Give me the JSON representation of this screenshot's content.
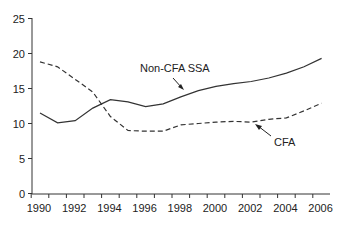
{
  "chart_data": {
    "type": "line",
    "title": "",
    "xlabel": "",
    "ylabel": "",
    "x": [
      1990,
      1991,
      1992,
      1993,
      1994,
      1995,
      1996,
      1997,
      1998,
      1999,
      2000,
      2001,
      2002,
      2003,
      2004,
      2005,
      2006
    ],
    "series": [
      {
        "name": "Non-CFA SSA",
        "style": "solid",
        "values": [
          11.5,
          10.1,
          10.4,
          12.2,
          13.4,
          13.1,
          12.4,
          12.8,
          13.8,
          14.7,
          15.3,
          15.7,
          16.0,
          16.5,
          17.2,
          18.1,
          19.3
        ]
      },
      {
        "name": "CFA",
        "style": "dashed",
        "values": [
          18.8,
          18.1,
          16.3,
          14.5,
          11.0,
          9.0,
          8.9,
          8.9,
          9.8,
          10.0,
          10.2,
          10.3,
          10.2,
          10.6,
          10.8,
          11.8,
          12.9
        ]
      }
    ],
    "xlim": [
      1990,
      2006
    ],
    "ylim": [
      0,
      25
    ],
    "x_ticks": [
      "1990",
      "1992",
      "1994",
      "1996",
      "1998",
      "2000",
      "2002",
      "2004",
      "2006"
    ],
    "y_ticks": [
      "0",
      "5",
      "10",
      "15",
      "20",
      "25"
    ],
    "grid": false,
    "legend": "none",
    "annotations": [
      {
        "text": "Non-CFA SSA",
        "series": "Non-CFA SSA",
        "arrow": true
      },
      {
        "text": "CFA",
        "series": "CFA",
        "arrow": true
      }
    ],
    "line_color": "#333333"
  }
}
